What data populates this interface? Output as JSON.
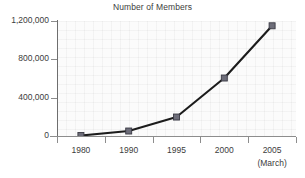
{
  "chart_data": {
    "type": "line",
    "title": "Number of Members",
    "xlabel": "",
    "ylabel": "",
    "categories": [
      "1980",
      "1990",
      "1995",
      "2000",
      "2005"
    ],
    "category_sublabels": [
      "",
      "",
      "",
      "",
      "(March)"
    ],
    "values": [
      5000,
      52000,
      198000,
      605000,
      1150000
    ],
    "series": [
      {
        "name": "Number of Members",
        "values": [
          5000,
          52000,
          198000,
          605000,
          1150000
        ]
      }
    ],
    "ylim": [
      0,
      1200000
    ],
    "ytick_values": [
      0,
      400000,
      800000,
      1200000
    ],
    "ytick_labels": [
      "0",
      "400,000",
      "800,000",
      "1,200,000"
    ],
    "grid": true,
    "legend": false,
    "legend_position": "none",
    "marker": "square",
    "colors": {
      "line": "#1c1c1c",
      "marker_fill": "#6d6d79",
      "marker_edge": "#3a3a44",
      "plot_background": "#fbfbfb",
      "axis": "#8d8d8d",
      "text": "#3c3c3c"
    }
  },
  "axes": {
    "y_ticks": [
      {
        "label": "1,200,000",
        "value": 1200000
      },
      {
        "label": "800,000",
        "value": 800000
      },
      {
        "label": "400,000",
        "value": 400000
      },
      {
        "label": "0",
        "value": 0
      }
    ],
    "x_ticks": [
      {
        "label": "1980",
        "sublabel": ""
      },
      {
        "label": "1990",
        "sublabel": ""
      },
      {
        "label": "1995",
        "sublabel": ""
      },
      {
        "label": "2000",
        "sublabel": ""
      },
      {
        "label": "2005",
        "sublabel": "(March)"
      }
    ]
  }
}
